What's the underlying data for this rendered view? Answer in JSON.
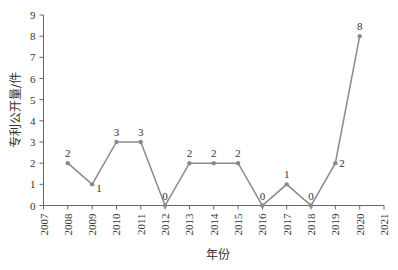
{
  "chart_data": {
    "type": "line",
    "title": "",
    "xlabel": "年份",
    "ylabel": "专利公开量/件",
    "x_ticks": [
      "2007",
      "2008",
      "2009",
      "2010",
      "2011",
      "2012",
      "2013",
      "2014",
      "2015",
      "2016",
      "2017",
      "2018",
      "2019",
      "2020",
      "2021"
    ],
    "y_ticks": [
      "0",
      "1",
      "2",
      "3",
      "4",
      "5",
      "6",
      "7",
      "8",
      "9"
    ],
    "xlim": [
      2007,
      2021
    ],
    "ylim": [
      0,
      9
    ],
    "grid": false,
    "legend": null,
    "series": [
      {
        "name": "专利公开量",
        "x": [
          2008,
          2009,
          2010,
          2011,
          2012,
          2013,
          2014,
          2015,
          2016,
          2017,
          2018,
          2019,
          2020
        ],
        "values": [
          2,
          1,
          3,
          3,
          0,
          2,
          2,
          2,
          0,
          1,
          0,
          2,
          8
        ],
        "color": "#8a8a8a"
      }
    ]
  }
}
